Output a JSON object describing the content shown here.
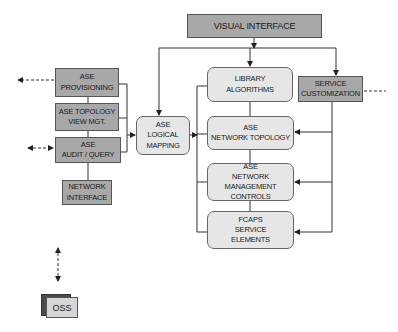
{
  "diagram": {
    "visual_interface": "VISUAL INTERFACE",
    "left_column": [
      {
        "id": "ase-provisioning",
        "lines": [
          "ASE",
          "PROVISIONING"
        ]
      },
      {
        "id": "ase-topology-view-mgt",
        "lines": [
          "ASE TOPOLOGY",
          "VIEW MGT."
        ]
      },
      {
        "id": "ase-audit-query",
        "lines": [
          "ASE",
          "AUDIT / QUERY"
        ]
      },
      {
        "id": "network-interface",
        "lines": [
          "NETWORK",
          "INTERFACE"
        ]
      }
    ],
    "logical_mapping": {
      "lines": [
        "ASE",
        "LOGICAL",
        "MAPPING"
      ]
    },
    "center_column": [
      {
        "id": "library-algorithms",
        "lines": [
          "LIBRARY",
          "ALGORITHMS"
        ]
      },
      {
        "id": "ase-network-topology",
        "lines": [
          "ASE",
          "NETWORK TOPOLOGY"
        ]
      },
      {
        "id": "ase-network-management-controls",
        "lines": [
          "ASE",
          "NETWORK MANAGEMENT",
          "CONTROLS"
        ]
      },
      {
        "id": "fcaps-service-elements",
        "lines": [
          "FCAPS",
          "SERVICE",
          "ELEMENTS"
        ]
      }
    ],
    "service_customization": {
      "lines": [
        "SERVICE",
        "CUSTOMIZATION"
      ]
    },
    "oss": "OSS"
  }
}
